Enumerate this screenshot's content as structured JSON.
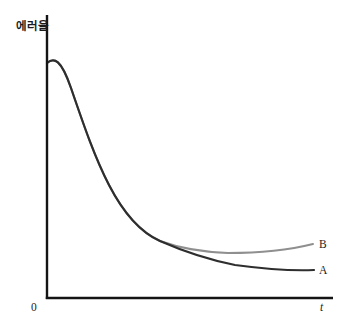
{
  "chart": {
    "ylabel": "에러율",
    "origin_label": "0",
    "xlabel": "t"
  },
  "colors": {
    "axis": "#141414",
    "background": "#ffffff",
    "curve_a": "#2e2e2e",
    "curve_b": "#8f8f8f"
  },
  "chart_data": {
    "type": "line",
    "title": "",
    "xlabel": "t",
    "ylabel": "에러율",
    "x_axis": {
      "origin_label": "0",
      "tick_labels": [],
      "numeric": false
    },
    "y_axis": {
      "tick_labels": [],
      "numeric": false
    },
    "grid": false,
    "legend_position": "end-of-line",
    "series": [
      {
        "name": "A",
        "label": "A",
        "color": "#2e2e2e",
        "stroke_width": 2.2,
        "svg_path": "M 47,63 C 54,57 61,59 71,88 C 84,126 95,158 109,185 C 124,214 142,233 160,241 C 185,252 210,260 235,265 C 265,269 293,271 314,270",
        "points_px": [
          [
            47,
            63
          ],
          [
            60,
            60
          ],
          [
            71,
            88
          ],
          [
            90,
            140
          ],
          [
            109,
            185
          ],
          [
            130,
            213
          ],
          [
            160,
            241
          ],
          [
            190,
            252
          ],
          [
            220,
            262
          ],
          [
            250,
            266
          ],
          [
            280,
            269
          ],
          [
            314,
            270
          ]
        ]
      },
      {
        "name": "B",
        "label": "B",
        "color": "#8f8f8f",
        "stroke_width": 2,
        "svg_path": "M 47,63 C 54,57 61,59 71,88 C 84,126 95,158 109,185 C 124,214 142,233 160,241 C 182,249 205,252 228,253 C 258,253 289,250 313,244",
        "points_px": [
          [
            47,
            63
          ],
          [
            60,
            60
          ],
          [
            71,
            88
          ],
          [
            90,
            140
          ],
          [
            109,
            185
          ],
          [
            130,
            213
          ],
          [
            160,
            241
          ],
          [
            190,
            248
          ],
          [
            220,
            253
          ],
          [
            250,
            252
          ],
          [
            285,
            248
          ],
          [
            313,
            244
          ]
        ]
      }
    ]
  }
}
